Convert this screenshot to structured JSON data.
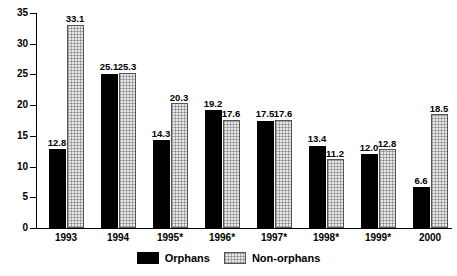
{
  "chart_data": {
    "type": "bar",
    "title": "",
    "xlabel": "",
    "ylabel": "",
    "ylim": [
      0,
      35
    ],
    "ytick_step": 5,
    "yticks": [
      "35",
      "30",
      "25",
      "20",
      "15",
      "10",
      "5",
      "0"
    ],
    "grid": false,
    "legend_position": "bottom-center",
    "categories": [
      "1993",
      "1994",
      "1995*",
      "1996*",
      "1997*",
      "1998*",
      "1999*",
      "2000"
    ],
    "series": [
      {
        "name": "Orphans",
        "color": "#000000",
        "values": [
          12.8,
          25.1,
          14.3,
          19.2,
          17.5,
          13.4,
          12.0,
          6.6
        ],
        "labels": [
          "12.8",
          "25.1",
          "14.3",
          "19.2",
          "17.5",
          "13.4",
          "12.0",
          "6.6"
        ]
      },
      {
        "name": "Non-orphans",
        "color": "#e8e8e8",
        "values": [
          33.1,
          25.3,
          20.3,
          17.6,
          17.6,
          11.2,
          12.8,
          18.5
        ],
        "labels": [
          "33.1",
          "25.3",
          "20.3",
          "17.6",
          "17.6",
          "11.2",
          "12.8",
          "18.5"
        ]
      }
    ]
  },
  "legend": {
    "items": [
      {
        "label": "Orphans",
        "swatch": "black-solid-swatch"
      },
      {
        "label": "Non-orphans",
        "swatch": "light-hatched-swatch"
      }
    ]
  }
}
